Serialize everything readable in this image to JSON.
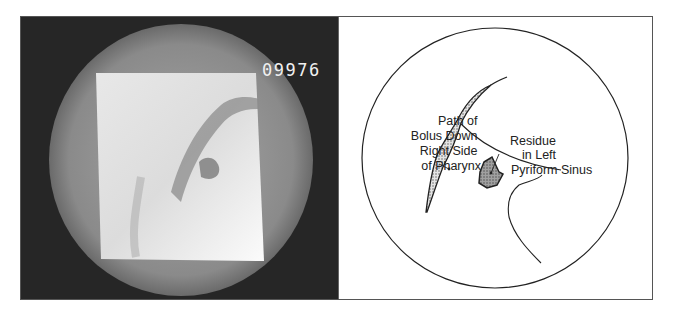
{
  "photo": {
    "counter": "09976",
    "description": "Fluoroscopic video frame of pharynx during swallow"
  },
  "diagram": {
    "labels": {
      "bolus_path": [
        "Path of",
        "Bolus Down",
        "Right Side",
        "of Pharynx"
      ],
      "residue": [
        "Residue",
        "in Left",
        "Pyriform Sinus"
      ]
    },
    "colors": {
      "photo_background": "#262626",
      "line": "#222222",
      "stipple_fill": "#c8c8c8",
      "residue_fill": "#9a9a9a"
    }
  }
}
